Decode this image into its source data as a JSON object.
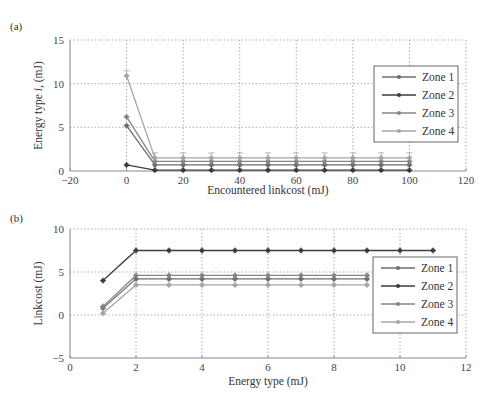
{
  "chart_data": [
    {
      "panel": "(a)",
      "type": "line",
      "title": "",
      "xlabel": "Encountered linkcost (mJ)",
      "ylabel": "Energy type i, (mJ)",
      "xlim": [
        -20,
        120
      ],
      "ylim": [
        0,
        15
      ],
      "xticks": [
        -20,
        0,
        20,
        40,
        60,
        80,
        100,
        120
      ],
      "yticks": [
        0,
        5,
        10,
        15
      ],
      "grid": true,
      "legend_position": "right-center",
      "x": [
        0,
        10,
        20,
        30,
        40,
        50,
        60,
        70,
        80,
        90,
        100
      ],
      "series": [
        {
          "name": "Zone 1",
          "color": "#6e6e6e",
          "values": [
            5.2,
            0.7,
            0.7,
            0.7,
            0.7,
            0.7,
            0.7,
            0.7,
            0.7,
            0.7,
            0.7
          ]
        },
        {
          "name": "Zone 2",
          "color": "#3c3c3c",
          "values": [
            0.7,
            0.1,
            0.1,
            0.1,
            0.1,
            0.1,
            0.1,
            0.1,
            0.1,
            0.1,
            0.1
          ]
        },
        {
          "name": "Zone 3",
          "color": "#858585",
          "values": [
            6.2,
            1.1,
            1.1,
            1.1,
            1.1,
            1.1,
            1.1,
            1.1,
            1.1,
            1.1,
            1.1
          ]
        },
        {
          "name": "Zone 4",
          "color": "#a6a6a6",
          "values": [
            10.9,
            1.5,
            1.5,
            1.5,
            1.5,
            1.5,
            1.5,
            1.5,
            1.5,
            1.5,
            1.5
          ]
        }
      ]
    },
    {
      "panel": "(b)",
      "type": "line",
      "title": "",
      "xlabel": "Energy type (mJ)",
      "ylabel": "Linkcost (mJ)",
      "xlim": [
        0,
        12
      ],
      "ylim": [
        -5,
        10
      ],
      "xticks": [
        0,
        2,
        4,
        6,
        8,
        10,
        12
      ],
      "yticks": [
        -5,
        0,
        5,
        10
      ],
      "grid": true,
      "legend_position": "right-center",
      "x": [
        1,
        2,
        3,
        4,
        5,
        6,
        7,
        8,
        9,
        10,
        11
      ],
      "series": [
        {
          "name": "Zone 1",
          "color": "#6e6e6e",
          "values": [
            0.8,
            4.2,
            4.2,
            4.2,
            4.2,
            4.2,
            4.2,
            4.2,
            4.2,
            null,
            null
          ]
        },
        {
          "name": "Zone 2",
          "color": "#3c3c3c",
          "values": [
            4.0,
            7.5,
            7.5,
            7.5,
            7.5,
            7.5,
            7.5,
            7.5,
            7.5,
            7.5,
            7.5
          ]
        },
        {
          "name": "Zone 3",
          "color": "#858585",
          "values": [
            1.0,
            4.6,
            4.6,
            4.6,
            4.6,
            4.6,
            4.6,
            4.6,
            4.6,
            null,
            null
          ]
        },
        {
          "name": "Zone 4",
          "color": "#a6a6a6",
          "values": [
            0.2,
            3.5,
            3.5,
            3.5,
            3.5,
            3.5,
            3.5,
            3.5,
            3.5,
            null,
            null
          ]
        }
      ]
    }
  ],
  "panels": {
    "a_label": "(a)",
    "b_label": "(b)"
  },
  "legend": [
    "Zone 1",
    "Zone 2",
    "Zone 3",
    "Zone 4"
  ]
}
